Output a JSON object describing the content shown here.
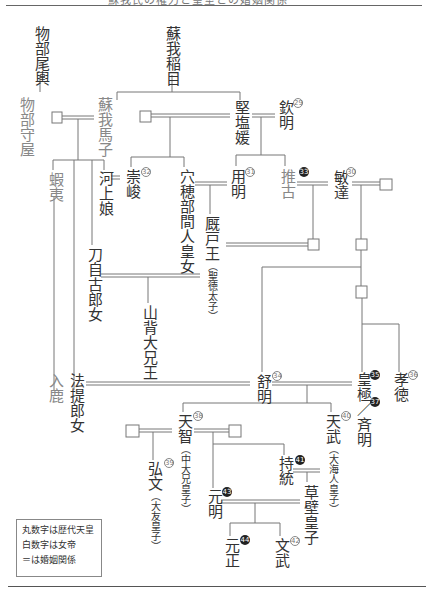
{
  "header": {
    "title": "蘇我氏の権力と皇室との婚姻関係"
  },
  "people": {
    "mononobe_okoshi": "物部尾輿",
    "soga_iname": "蘇我稲目",
    "mononobe_moriya": "物部守屋",
    "soga_umako": "蘇我馬子",
    "kitashihime": "堅塩媛",
    "kinmei": "欽明",
    "emishi": "蝦夷",
    "kawakami": "河上娘",
    "sushun": "崇峻",
    "anahobe": "穴穂部間人皇女",
    "yomei": "用明",
    "suiko": "推古",
    "bidatsu": "敏達",
    "umayado": "厩戸王",
    "umayado_sub": "（聖徳太子）",
    "tojiko": "刀自古郎女",
    "yamashiro": "山背大兄王",
    "iruka": "入鹿",
    "hotei": "法提郎女",
    "jomei": "舒明",
    "kogyoku": "皇極",
    "saimei": "斉明",
    "kotoku": "孝徳",
    "tenji": "天智",
    "tenji_sub": "（中大兄皇子）",
    "tenmu": "天武",
    "tenmu_sub": "（大海人皇子）",
    "kobun": "弘文",
    "kobun_sub": "（大友皇子）",
    "jito": "持統",
    "genmei": "元明",
    "kusakabe": "草壁皇子",
    "gensho": "元正",
    "monmu": "文武"
  },
  "numbers": {
    "kinmei": "29",
    "bidatsu": "30",
    "yomei": "31",
    "sushun": "32",
    "suiko": "33",
    "jomei": "34",
    "kogyoku": "35",
    "kotoku": "36",
    "saimei": "37",
    "tenji": "38",
    "kobun": "39",
    "tenmu": "40",
    "jito": "41",
    "monmu": "42",
    "genmei": "43",
    "gensho": "44"
  },
  "legend": {
    "line1": "丸数字は歴代天皇",
    "line2": "白数字は女帝",
    "line3": "＝は婚姻関係"
  },
  "colors": {
    "line": "#777777",
    "soga_text": "#888888",
    "text": "#333333"
  }
}
